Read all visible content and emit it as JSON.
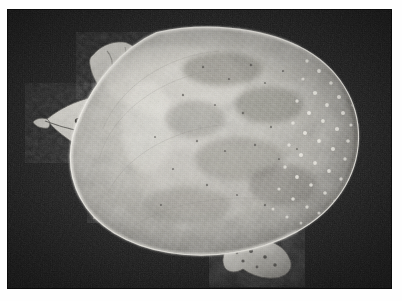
{
  "page": {
    "width": 402,
    "height": 301,
    "paper_color": "#fefefe",
    "margin_note": "white photographic paper border surrounding the print"
  },
  "photo": {
    "title": "Softshell turtle, dorsal view",
    "medium": "black and white photograph",
    "background_color": "#232323",
    "print": {
      "left": 7,
      "top": 9,
      "width": 385,
      "height": 280
    },
    "subject": {
      "name": "softshell turtle",
      "view": "dorsal (top-down)",
      "orientation": "head toward lower left, tail toward right",
      "parts": [
        {
          "id": "carapace",
          "label": "carapace (leathery shell)",
          "tone": "light gray, mottled"
        },
        {
          "id": "carapace-rim",
          "label": "pale shell rim",
          "tone": "bright white highlight"
        },
        {
          "id": "tubercle-field",
          "label": "spiny tubercles along shell margin",
          "tone": "white speckles on dark band"
        },
        {
          "id": "head",
          "label": "head with pointed proboscis snout",
          "tone": "light gray"
        },
        {
          "id": "eye",
          "label": "eye",
          "tone": "dark"
        },
        {
          "id": "front-foot",
          "label": "clawed front foot",
          "tone": "mid gray"
        },
        {
          "id": "front-flipper",
          "label": "upper front limb",
          "tone": "light gray"
        },
        {
          "id": "rear-foot",
          "label": "rear foot",
          "tone": "mottled gray"
        }
      ]
    },
    "colors": {
      "backdrop_dark": "#1b1b1b",
      "backdrop_mid": "#2e2e2e",
      "shell_light": "#d8d6cf",
      "shell_mid": "#a9a7a0",
      "shell_dark": "#6d6b66",
      "rim_highlight": "#f2f0ea",
      "limb_gray": "#b9b7b0",
      "paper_white": "#fefefe"
    }
  }
}
